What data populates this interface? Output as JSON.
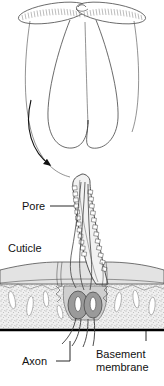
{
  "figure": {
    "name": "insect-antenna-sensillum-diagram",
    "type": "biological-line-diagram",
    "background_color": "#ffffff",
    "ink_color": "#111111",
    "rendering": "black-and-white line art with grayscale shading"
  },
  "palette": {
    "ink": "#111111",
    "line": "#3a3a3a",
    "hair_fill": "#f2f2f2",
    "cuticle_fill": "#e3e3e3",
    "epidermis_fill": "#efefef",
    "sheath_fill": "#cfcfcf",
    "cell_body_fill": "#9a9a9a",
    "cell_outline": "#555555",
    "nucleus_fill": "#ffffff",
    "basement_membrane": "#000000",
    "white": "#ffffff"
  },
  "panels": {
    "top": {
      "name": "whole-antenna-view",
      "description": "Plumose moth antenna with paired feathery branches at the apex and two long tapering rami descending"
    },
    "bottom": {
      "name": "sensillum-detail-view",
      "description": "Magnified longitudinal section of a multiporous olfactory sensillum passing through the cuticle to two sensory neuron cell bodies"
    }
  },
  "connector": {
    "name": "magnification-arrow",
    "description": "Curved arrow leading from the antenna branch down to the magnified sensillum",
    "arrowhead": "filled-triangle"
  },
  "labels": [
    {
      "id": "pore",
      "text": "Pore",
      "x": 22,
      "y": 210,
      "anchor": "start",
      "leader": {
        "from_x": 50,
        "from_y": 206,
        "to_x": 74,
        "to_y": 206
      }
    },
    {
      "id": "cuticle",
      "text": "Cuticle",
      "x": 8,
      "y": 252,
      "anchor": "start",
      "leader": null
    },
    {
      "id": "axon",
      "text": "Axon",
      "x": 22,
      "y": 365,
      "anchor": "start",
      "leader": {
        "from_x": 56,
        "from_y": 361,
        "to_x": 78,
        "to_y": 361,
        "elbow_y": 340
      }
    },
    {
      "id": "basement-membrane",
      "text_line_1": "Basement",
      "text_line_2": "membrane",
      "x": 96,
      "y": 358,
      "anchor": "start",
      "leader": {
        "from_x": 146,
        "from_y": 340,
        "to_x": 146,
        "to_y": 330
      }
    }
  ],
  "structures": [
    {
      "id": "hair-shaft",
      "name": "sensillum-hair-shaft",
      "note": "curved tapering hair with pore openings drawn as small rectangles along both walls"
    },
    {
      "id": "pores",
      "name": "cuticular-pores",
      "note": "rows of small rectangular openings along the hair wall"
    },
    {
      "id": "dendrites",
      "name": "dendrites",
      "note": "two slender dendrites running inside the hair lumen"
    },
    {
      "id": "cuticle-layer",
      "name": "cuticle-layer",
      "note": "light grey horizontal band forming the antennal surface"
    },
    {
      "id": "epidermis",
      "name": "epidermis",
      "note": "stippled tissue with white lens-shaped cells beneath the cuticle"
    },
    {
      "id": "sheath-cells",
      "name": "sheath-cells",
      "note": "grey envelope surrounding the neuron cell bodies"
    },
    {
      "id": "neuron-cell-bodies",
      "name": "neuron-cell-bodies",
      "note": "two grey oval somata each containing a white nucleus"
    },
    {
      "id": "axons",
      "name": "axons",
      "note": "paired fibres descending through and below the basement membrane"
    },
    {
      "id": "basement-membrane-line",
      "name": "basement-membrane",
      "note": "thick black horizontal line below the epidermis"
    }
  ]
}
